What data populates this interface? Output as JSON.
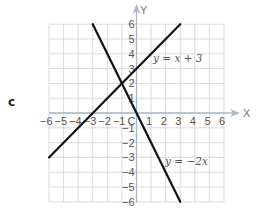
{
  "panel_label": "c",
  "axes": {
    "x_name": "X",
    "y_name": "Y",
    "x_ticks": [
      "−6",
      "−5",
      "−4",
      "−3",
      "−2",
      "−1",
      "C",
      "1",
      "2",
      "3",
      "4",
      "5",
      "6"
    ],
    "y_ticks_pos": [
      "1",
      "2",
      "3",
      "4",
      "5",
      "6"
    ],
    "y_ticks_neg": [
      "−1",
      "−2",
      "−3",
      "−4",
      "−5",
      "−6"
    ]
  },
  "lines": [
    {
      "label": "y = x + 3",
      "equation": "y = x + 3",
      "x_from": -6,
      "x_to": 3,
      "color": "#111111"
    },
    {
      "label": "y = −2x",
      "equation": "y = -2x",
      "x_from": -3,
      "x_to": 3,
      "color": "#111111"
    }
  ],
  "colors": {
    "grid": "#d0d0d0",
    "axis": "#a8b8c8",
    "line": "#111111",
    "text": "#555555"
  },
  "chart_data": {
    "type": "line",
    "title": "",
    "xlabel": "X",
    "ylabel": "Y",
    "xlim": [
      -6,
      6
    ],
    "ylim": [
      -6,
      6
    ],
    "grid": true,
    "series": [
      {
        "name": "y = x + 3",
        "x": [
          -6,
          3
        ],
        "y": [
          -3,
          6
        ]
      },
      {
        "name": "y = −2x",
        "x": [
          -3,
          3
        ],
        "y": [
          6,
          -6
        ]
      }
    ],
    "annotations": [
      "y = x + 3",
      "y = −2x",
      "c"
    ],
    "intersection": [
      -1,
      2
    ]
  }
}
